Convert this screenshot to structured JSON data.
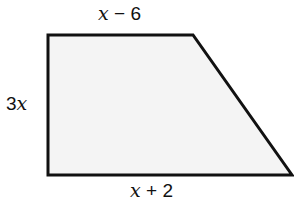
{
  "diagram": {
    "shape": "trapezoid",
    "vertices": [
      [
        48,
        35
      ],
      [
        193,
        35
      ],
      [
        292,
        175
      ],
      [
        48,
        175
      ]
    ],
    "fill_color": "#f4f4f4",
    "stroke_color": "#111111",
    "labels": {
      "top": {
        "var": "x",
        "op": " − ",
        "num": "6"
      },
      "left": {
        "num": "3",
        "var": "x"
      },
      "bottom": {
        "var": "x",
        "op": " + ",
        "num": "2"
      }
    }
  }
}
